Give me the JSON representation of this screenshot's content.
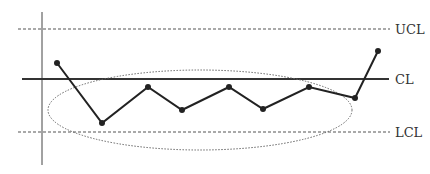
{
  "chart_data": {
    "type": "line",
    "title": "",
    "xlabel": "",
    "ylabel": "",
    "grid": false,
    "legend": "none",
    "control_limits": [
      {
        "name": "UCL",
        "label": "UCL",
        "style": "dashed",
        "y_px": 29
      },
      {
        "name": "CL",
        "label": "CL",
        "style": "solid",
        "y_px": 79
      },
      {
        "name": "LCL",
        "label": "LCL",
        "style": "dashed",
        "y_px": 132
      }
    ],
    "series": [
      {
        "name": "process",
        "points_px": [
          [
            57,
            63
          ],
          [
            102,
            123
          ],
          [
            148,
            87
          ],
          [
            182,
            110
          ],
          [
            229,
            87
          ],
          [
            263,
            109
          ],
          [
            309,
            87
          ],
          [
            355,
            98
          ],
          [
            378,
            51
          ]
        ]
      }
    ],
    "annotations": [
      {
        "type": "ellipse",
        "style": "dotted",
        "cx": 200,
        "cy": 110,
        "rx": 152,
        "ry": 40,
        "note": "encircles points below center line"
      }
    ]
  },
  "labels": {
    "ucl": "UCL",
    "cl": "CL",
    "lcl": "LCL"
  },
  "colors": {
    "line": "#222222",
    "limits": "#555555",
    "ellipse": "#666666",
    "text": "#333333"
  }
}
